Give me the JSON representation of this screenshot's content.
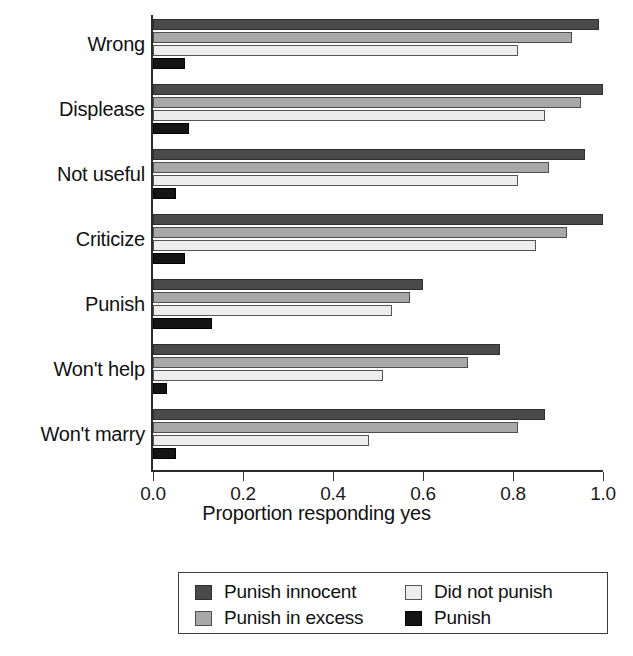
{
  "chart_data": {
    "type": "bar",
    "orientation": "horizontal",
    "title": "",
    "xlabel": "Proportion responding yes",
    "ylabel": "",
    "xlim": [
      0.0,
      1.0
    ],
    "xticks": [
      "0.0",
      "0.2",
      "0.4",
      "0.6",
      "0.8",
      "1.0"
    ],
    "xtick_values": [
      0.0,
      0.2,
      0.4,
      0.6,
      0.8,
      1.0
    ],
    "grid": false,
    "legend_position": "bottom",
    "categories": [
      "Wrong",
      "Displease",
      "Not useful",
      "Criticize",
      "Punish",
      "Won't help",
      "Won't marry"
    ],
    "series": [
      {
        "name": "Punish innocent",
        "color": "#4a4a4a",
        "values": [
          0.99,
          1.0,
          0.96,
          1.0,
          0.6,
          0.77,
          0.87
        ]
      },
      {
        "name": "Punish in excess",
        "color": "#a8a8a8",
        "values": [
          0.93,
          0.95,
          0.88,
          0.92,
          0.57,
          0.7,
          0.81
        ]
      },
      {
        "name": "Did not punish",
        "color": "#ededed",
        "values": [
          0.81,
          0.87,
          0.81,
          0.85,
          0.53,
          0.51,
          0.48
        ]
      },
      {
        "name": "Punish",
        "color": "#141414",
        "values": [
          0.07,
          0.08,
          0.05,
          0.07,
          0.13,
          0.03,
          0.05
        ]
      }
    ],
    "legend_entries": [
      "Punish innocent",
      "Did not punish",
      "Punish in excess",
      "Punish"
    ]
  }
}
